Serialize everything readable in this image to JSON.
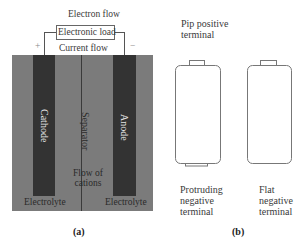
{
  "panel_a": {
    "electron_flow_label": "Electron flow",
    "load_label": "Electronic load",
    "current_flow_label": "Current flow",
    "positive_sign": "+",
    "negative_sign": "−",
    "cathode_label": "Cathode",
    "anode_label": "Anode",
    "separator_label": "Separator",
    "cations_line1": "Flow of",
    "cations_line2": "cations",
    "electrolyte_left": "Electrolyte",
    "electrolyte_right": "Electrolyte",
    "caption": "(a)",
    "colors": {
      "electrolyte": "#7b7b7b",
      "electrode": "#333333"
    }
  },
  "panel_b": {
    "pip_positive_line1": "Pip positive",
    "pip_positive_line2": "terminal",
    "protruding_line1": "Protruding",
    "protruding_line2": "negative",
    "protruding_line3": "terminal",
    "flat_line1": "Flat",
    "flat_line2": "negative",
    "flat_line3": "terminal",
    "caption": "(b)"
  }
}
